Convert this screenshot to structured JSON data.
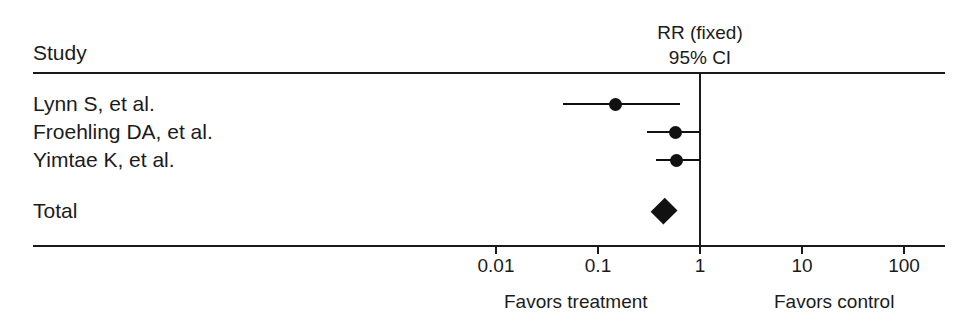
{
  "header": {
    "study_column_label": "Study",
    "effect_measure_line1": "RR (fixed)",
    "effect_measure_line2": "95% CI"
  },
  "axis": {
    "tick_labels": [
      "0.01",
      "0.1",
      "1",
      "10",
      "100"
    ],
    "favors_left": "Favors treatment",
    "favors_right": "Favors control"
  },
  "rows": {
    "total_label": "Total"
  },
  "colors": {
    "ink": "#111111",
    "rule": "#1a1a1a",
    "background": "#ffffff"
  },
  "chart_data": {
    "type": "forest",
    "title": "",
    "xlabel": "",
    "ylabel": "",
    "effect_measure": "RR (fixed)",
    "confidence_level": "95% CI",
    "scale": "log10",
    "xlim": [
      0.003,
      300
    ],
    "xticks": [
      0.01,
      0.1,
      1,
      10,
      100
    ],
    "xtick_labels": [
      "0.01",
      "0.1",
      "1",
      "10",
      "100"
    ],
    "null_line": 1,
    "grid": false,
    "legend": "none",
    "favors_left_label": "Favors treatment",
    "favors_right_label": "Favors control",
    "studies": [
      {
        "label": "Lynn S, et al.",
        "estimate": 0.15,
        "ci_low": 0.045,
        "ci_high": 0.63
      },
      {
        "label": "Froehling DA, et al.",
        "estimate": 0.57,
        "ci_low": 0.3,
        "ci_high": 1.0
      },
      {
        "label": "Yimtae K, et al.",
        "estimate": 0.59,
        "ci_low": 0.37,
        "ci_high": 1.0
      }
    ],
    "summary": {
      "label": "Total",
      "estimate": 0.43,
      "ci_low": 0.33,
      "ci_high": 0.58
    }
  }
}
